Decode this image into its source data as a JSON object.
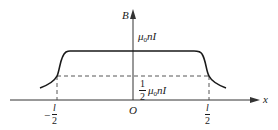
{
  "diagram": {
    "type": "magnetic-field-along-solenoid-axis",
    "axes": {
      "x_label": "x",
      "y_label": "B",
      "origin_label": "O"
    },
    "labels": {
      "plateau": {
        "mu": "μ",
        "sub": "0",
        "rest": "nI"
      },
      "half": {
        "frac_num": "1",
        "frac_den": "2",
        "mu": "μ",
        "sub": "0",
        "rest": "nI"
      },
      "left_tick": {
        "sign": "−",
        "num": "l",
        "den": "2"
      },
      "right_tick": {
        "num": "l",
        "den": "2"
      }
    },
    "colors": {
      "curve": "#1a1a1a",
      "axes": "#333333",
      "dashed": "#444444",
      "background": "#ffffff"
    }
  }
}
